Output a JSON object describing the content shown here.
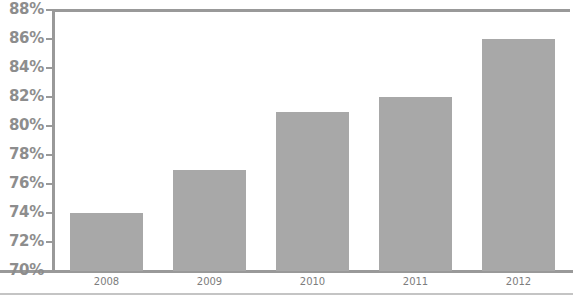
{
  "chart_data": {
    "type": "bar",
    "title": "",
    "title_truncated_note": "",
    "xlabel": "",
    "ylabel": "",
    "categories": [
      "2008",
      "2009",
      "2010",
      "2011",
      "2012"
    ],
    "values": [
      74,
      77,
      81,
      82,
      86
    ],
    "value_suffix": "%",
    "ylim": [
      70,
      88
    ],
    "ytick_step": 2,
    "ytick_labels": [
      "88%",
      "86%",
      "84%",
      "82%",
      "80%",
      "78%",
      "76%",
      "74%",
      "72%",
      "70%"
    ],
    "ytick_values": [
      88,
      86,
      84,
      82,
      80,
      78,
      76,
      74,
      72,
      70
    ],
    "grid": false,
    "legend": false,
    "legend_position": "none",
    "series": [
      {
        "name": "",
        "values": [
          74,
          77,
          81,
          82,
          86
        ]
      }
    ],
    "colors": {
      "bar_fill": "#a8a8a8",
      "axis_line": "#999999",
      "y_label_text": "#8d8d8d",
      "x_label_text": "#7d7d7d",
      "background": "#ffffff",
      "outer_border": "#c4c4c4"
    }
  }
}
